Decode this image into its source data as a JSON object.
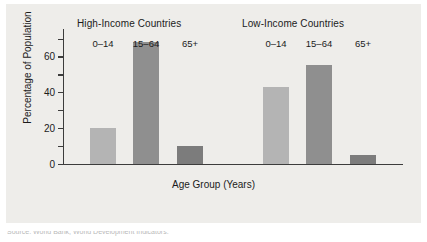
{
  "figure": {
    "background_color": "#eeedea",
    "caption_partial": "Source: World Bank, World Development Indicators."
  },
  "chart_data": {
    "type": "bar",
    "title": "",
    "xlabel": "Age Group (Years)",
    "ylabel": "Percentage of Population",
    "ylim": [
      0,
      75
    ],
    "yticks": [
      0,
      20,
      40,
      60
    ],
    "yticks_minor": [
      10,
      30,
      50,
      70
    ],
    "grid": false,
    "legend": "none",
    "group_titles": [
      "High-Income Countries",
      "Low-Income Countries"
    ],
    "categories": [
      "0–14",
      "15–64",
      "65+"
    ],
    "series": [
      {
        "name": "High-Income Countries",
        "values": [
          20,
          68,
          10
        ]
      },
      {
        "name": "Low-Income Countries",
        "values": [
          43,
          55,
          5
        ]
      }
    ],
    "bar_colors": [
      "#b4b4b4",
      "#8f8f8f",
      "#7c7c7c"
    ]
  },
  "bars": [
    {
      "group": "High-Income Countries",
      "category": "0–14",
      "value": 20,
      "color": "#b4b4b4"
    },
    {
      "group": "High-Income Countries",
      "category": "15–64",
      "value": 68,
      "color": "#8f8f8f"
    },
    {
      "group": "High-Income Countries",
      "category": "65+",
      "value": 10,
      "color": "#7c7c7c"
    },
    {
      "group": "Low-Income Countries",
      "category": "0–14",
      "value": 43,
      "color": "#b4b4b4"
    },
    {
      "group": "Low-Income Countries",
      "category": "15–64",
      "value": 55,
      "color": "#8f8f8f"
    },
    {
      "group": "Low-Income Countries",
      "category": "65+",
      "value": 5,
      "color": "#7c7c7c"
    }
  ],
  "ytick_labels": [
    "0",
    "20",
    "40",
    "60"
  ]
}
